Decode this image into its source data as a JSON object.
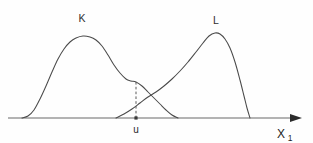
{
  "figure": {
    "background_color": "#fefefe",
    "curve_color": "#4a4a4a",
    "axis_color": "#9a9a9a",
    "dashed_color": "#5a5a5a",
    "label_color": "#303030",
    "labels": {
      "curve_k": "K",
      "curve_l": "L",
      "threshold": "u",
      "axis_x": "X",
      "axis_x_subscript": "1"
    }
  },
  "chart_data": {
    "type": "line",
    "title": "",
    "subtitle": "",
    "xlabel": "X₁",
    "ylabel": "",
    "grid": false,
    "legend": "inline-labels",
    "xlim": [
      8,
      305
    ],
    "ylim": [
      0,
      143
    ],
    "annotations": [
      {
        "name": "curve-k-label",
        "text": "K",
        "x": 82,
        "y": 22
      },
      {
        "name": "curve-l-label",
        "text": "L",
        "x": 216,
        "y": 24
      },
      {
        "name": "threshold-label",
        "text": "u",
        "x": 136,
        "y": 130
      },
      {
        "name": "axis-label",
        "text": "X₁",
        "x": 285,
        "y": 136
      }
    ],
    "reference_lines": [
      {
        "name": "threshold-u",
        "orientation": "vertical",
        "x": 136,
        "y_from": 82,
        "y_to": 118,
        "style": "dashed",
        "label": "u"
      }
    ],
    "markers": [
      {
        "name": "threshold-axis-dot",
        "x": 136,
        "y": 118
      },
      {
        "name": "curve-intersection",
        "x": 156,
        "y": 92
      }
    ],
    "axis": {
      "baseline_y": 118,
      "x_start": 8,
      "x_end": 298,
      "arrow": true
    },
    "series": [
      {
        "name": "K",
        "label": "K",
        "peak_x": 83,
        "peak_y": 36,
        "baseline_start_x": 22,
        "baseline_end_x": 178,
        "points": [
          [
            22,
            118
          ],
          [
            28,
            116
          ],
          [
            34,
            110
          ],
          [
            40,
            99
          ],
          [
            46,
            86
          ],
          [
            52,
            72
          ],
          [
            58,
            59
          ],
          [
            64,
            49
          ],
          [
            70,
            42
          ],
          [
            76,
            38
          ],
          [
            83,
            36
          ],
          [
            90,
            37
          ],
          [
            96,
            40
          ],
          [
            102,
            46
          ],
          [
            108,
            55
          ],
          [
            114,
            65
          ],
          [
            120,
            73
          ],
          [
            126,
            79
          ],
          [
            131,
            81
          ],
          [
            136,
            82
          ],
          [
            142,
            86
          ],
          [
            148,
            92
          ],
          [
            154,
            98
          ],
          [
            160,
            104
          ],
          [
            166,
            110
          ],
          [
            172,
            115
          ],
          [
            178,
            118
          ]
        ]
      },
      {
        "name": "L",
        "label": "L",
        "peak_x": 215,
        "peak_y": 33,
        "baseline_start_x": 116,
        "baseline_end_x": 250,
        "points": [
          [
            116,
            118
          ],
          [
            124,
            114
          ],
          [
            132,
            109
          ],
          [
            140,
            103
          ],
          [
            148,
            97
          ],
          [
            156,
            92
          ],
          [
            164,
            86
          ],
          [
            172,
            79
          ],
          [
            180,
            71
          ],
          [
            188,
            62
          ],
          [
            196,
            52
          ],
          [
            203,
            43
          ],
          [
            209,
            36
          ],
          [
            215,
            33
          ],
          [
            220,
            34
          ],
          [
            225,
            39
          ],
          [
            230,
            48
          ],
          [
            235,
            62
          ],
          [
            240,
            80
          ],
          [
            244,
            96
          ],
          [
            247,
            108
          ],
          [
            250,
            118
          ]
        ]
      }
    ]
  }
}
